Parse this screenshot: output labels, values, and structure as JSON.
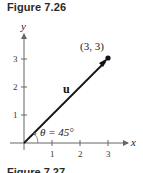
{
  "figure": {
    "title": "Figure 7.26",
    "next_title": "Figure 7.27"
  },
  "axes": {
    "x_label": "x",
    "y_label": "y",
    "x_ticks": [
      "1",
      "2",
      "3"
    ],
    "y_ticks": [
      "1",
      "2",
      "3"
    ]
  },
  "vector": {
    "name": "u",
    "from": [
      0,
      0
    ],
    "to": [
      3,
      3
    ],
    "point_label": "(3, 3)",
    "angle_label": "θ = 45°"
  },
  "colors": {
    "axis": "#555555",
    "vector": "#111111",
    "text": "#222222"
  }
}
